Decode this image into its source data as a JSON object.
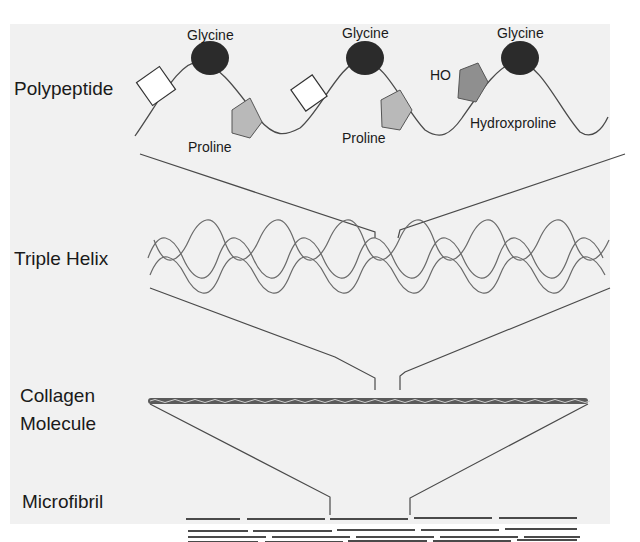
{
  "diagram": {
    "type": "collagen-hierarchy",
    "levels": [
      {
        "id": "polypeptide",
        "label": "Polypeptide"
      },
      {
        "id": "triple-helix",
        "label": "Triple Helix"
      },
      {
        "id": "collagen-molecule",
        "label_line1": "Collagen",
        "label_line2": "Molecule"
      },
      {
        "id": "microfibril",
        "label": "Microfibril"
      }
    ],
    "residues": {
      "glycine_1": "Glycine",
      "glycine_2": "Glycine",
      "glycine_3": "Glycine",
      "proline_1": "Proline",
      "proline_2": "Proline",
      "hydroxyproline": "Hydroxproline",
      "ho": "HO"
    },
    "colors": {
      "background": "#f1f1f1",
      "line": "#4a4a4a",
      "glycine": "#2b2b2b",
      "proline": "#b9b9b9",
      "hydroxyproline": "#8f8f8f",
      "helix": "#6a6a6a"
    }
  }
}
